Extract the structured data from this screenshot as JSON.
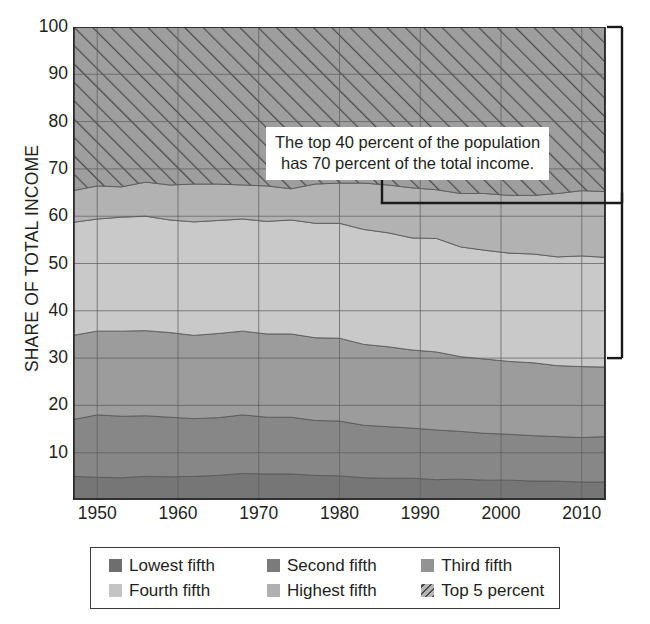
{
  "chart_data": {
    "type": "area",
    "title": "",
    "xlabel": "",
    "ylabel": "SHARE OF TOTAL INCOME",
    "xlim": [
      1947,
      2013
    ],
    "ylim": [
      0,
      100
    ],
    "grid": true,
    "legend_position": "bottom",
    "xticks": [
      1950,
      1960,
      1970,
      1980,
      1990,
      2000,
      2010
    ],
    "yticks": [
      10,
      20,
      30,
      40,
      50,
      60,
      70,
      80,
      90,
      100
    ],
    "x": [
      1947,
      1950,
      1953,
      1956,
      1959,
      1962,
      1965,
      1968,
      1971,
      1974,
      1977,
      1980,
      1983,
      1986,
      1989,
      1992,
      1995,
      1998,
      2001,
      2004,
      2007,
      2010,
      2013
    ],
    "series": [
      {
        "name": "Lowest fifth",
        "color": "#6e6e6e",
        "values": [
          5.0,
          4.8,
          4.7,
          5.0,
          4.9,
          5.0,
          5.2,
          5.6,
          5.5,
          5.5,
          5.2,
          5.1,
          4.7,
          4.6,
          4.6,
          4.3,
          4.4,
          4.2,
          4.2,
          4.0,
          4.0,
          3.8,
          3.8
        ]
      },
      {
        "name": "Second fifth",
        "color": "#7b7b7b",
        "values": [
          12.0,
          13.2,
          13.0,
          12.8,
          12.6,
          12.2,
          12.2,
          12.4,
          12.0,
          12.0,
          11.6,
          11.6,
          11.1,
          10.9,
          10.6,
          10.5,
          10.1,
          9.9,
          9.7,
          9.6,
          9.4,
          9.4,
          9.6
        ]
      },
      {
        "name": "Third fifth",
        "color": "#939393",
        "values": [
          17.8,
          17.7,
          18.0,
          18.0,
          17.9,
          17.6,
          17.8,
          17.7,
          17.6,
          17.6,
          17.5,
          17.5,
          17.1,
          16.9,
          16.5,
          16.5,
          15.8,
          15.7,
          15.4,
          15.4,
          15.0,
          15.0,
          14.7
        ]
      },
      {
        "name": "Fourth fifth",
        "color": "#b9b9b9",
        "values": [
          23.9,
          23.7,
          24.1,
          24.2,
          23.8,
          24.0,
          23.9,
          23.7,
          23.8,
          24.1,
          24.2,
          24.3,
          24.3,
          24.1,
          23.7,
          24.0,
          23.2,
          23.0,
          22.9,
          23.0,
          23.0,
          23.4,
          23.2
        ]
      },
      {
        "name": "Highest fifth",
        "color": "#a8a8a8",
        "values": [
          24.0,
          23.8,
          23.3,
          23.6,
          24.1,
          24.6,
          24.3,
          23.9,
          24.3,
          23.7,
          24.9,
          25.0,
          26.3,
          26.8,
          27.6,
          27.5,
          28.9,
          29.6,
          30.0,
          30.2,
          31.0,
          31.1,
          31.3
        ]
      },
      {
        "name": "Top 5 percent",
        "color": "#9e9e9e",
        "hatch": "diagonal",
        "values": [
          17.3,
          16.8,
          16.9,
          16.4,
          16.7,
          16.6,
          16.6,
          16.7,
          16.8,
          17.1,
          16.6,
          16.5,
          16.5,
          16.7,
          17.0,
          17.2,
          17.6,
          17.6,
          17.8,
          17.8,
          17.6,
          17.3,
          17.4
        ]
      }
    ],
    "annotation": {
      "line1": "The top 40 percent of the population",
      "line2": "has 70 percent of the total income.",
      "bracket_from": 100,
      "bracket_to": 30
    }
  },
  "axes": {
    "y_title": "SHARE OF TOTAL INCOME",
    "y_ticks": [
      "100",
      "90",
      "80",
      "70",
      "60",
      "50",
      "40",
      "30",
      "20",
      "10"
    ],
    "x_ticks": [
      "1950",
      "1960",
      "1970",
      "1980",
      "1990",
      "2000",
      "2010"
    ]
  },
  "annotation": {
    "line1": "The top 40 percent of the population",
    "line2": "has 70 percent of the total income."
  },
  "legend": {
    "row1": [
      {
        "label": "Lowest fifth",
        "color": "#6e6e6e",
        "hatch": "none"
      },
      {
        "label": "Second fifth",
        "color": "#7b7b7b",
        "hatch": "none"
      },
      {
        "label": "Third fifth",
        "color": "#939393",
        "hatch": "none"
      }
    ],
    "row2": [
      {
        "label": "Fourth fifth",
        "color": "#c4c4c4",
        "hatch": "none"
      },
      {
        "label": "Highest fifth",
        "color": "#b0b0b0",
        "hatch": "none"
      },
      {
        "label": "Top 5 percent",
        "color": "#9e9e9e",
        "hatch": "diagonal"
      }
    ]
  }
}
